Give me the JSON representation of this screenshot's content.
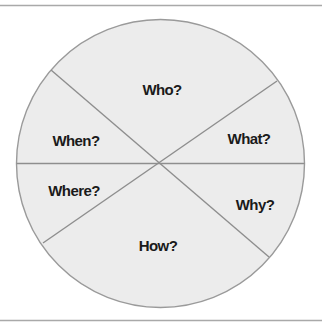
{
  "diagram": {
    "type": "divided-circle",
    "colors": {
      "rule": "#a9a9a9",
      "circle_fill": "#ececec",
      "circle_stroke": "#9a9a9a",
      "divider": "#8e8e8e",
      "text": "#1a1a1a"
    },
    "segments": [
      {
        "id": "who",
        "label": "Who?"
      },
      {
        "id": "what",
        "label": "What?"
      },
      {
        "id": "why",
        "label": "Why?"
      },
      {
        "id": "how",
        "label": "How?"
      },
      {
        "id": "where",
        "label": "Where?"
      },
      {
        "id": "when",
        "label": "When?"
      }
    ]
  }
}
